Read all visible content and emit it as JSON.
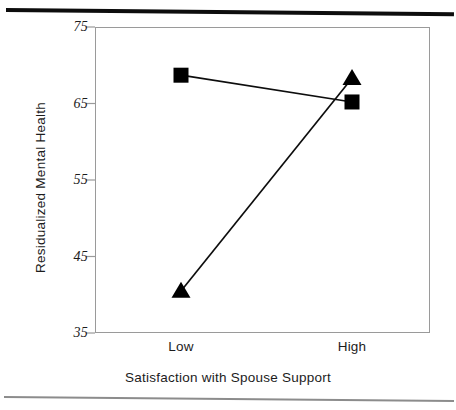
{
  "chart_data": {
    "type": "line",
    "title": "",
    "subtitle": "",
    "xlabel": "Satisfaction with Spouse Support",
    "ylabel": "Residualized Mental Health",
    "categories": [
      "Low",
      "High"
    ],
    "ylim": [
      35,
      75
    ],
    "yticks": [
      35,
      45,
      55,
      65,
      75
    ],
    "ytick_labels": [
      "35",
      "45",
      "55",
      "65",
      "75"
    ],
    "grid": false,
    "legend": "none",
    "series": [
      {
        "name": "square-series",
        "marker": "square",
        "color": "#000000",
        "values": [
          68.7,
          65.2
        ]
      },
      {
        "name": "triangle-series",
        "marker": "triangle",
        "color": "#000000",
        "values": [
          40.5,
          68.3
        ]
      }
    ]
  },
  "axes": {
    "y_title": "Residualized Mental Health",
    "x_title": "Satisfaction with Spouse Support",
    "y_ticks": [
      "75",
      "65",
      "55",
      "45",
      "35"
    ],
    "x_ticks": [
      "Low",
      "High"
    ]
  },
  "colors": {
    "marker": "#000000",
    "line": "#0d0d0d",
    "frame": "#9a9a9a",
    "rule_top": "#0d0d0d",
    "rule_bottom": "#8c8c8c",
    "background": "#ffffff"
  }
}
